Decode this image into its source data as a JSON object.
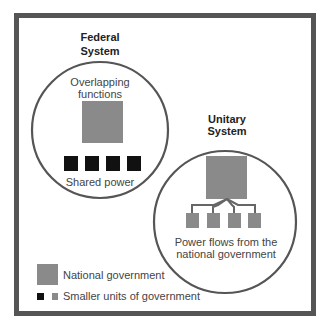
{
  "colors": {
    "frame": "#555555",
    "circle": "#555555",
    "national": "#8a8a8a",
    "federal_unit": "#111111",
    "unitary_unit": "#8a8a8a",
    "text": "#444444"
  },
  "federal": {
    "title_line1": "Federal",
    "title_line2": "System",
    "top_caption_line1": "Overlapping",
    "top_caption_line2": "functions",
    "bottom_caption": "Shared power",
    "unit_count": 4
  },
  "unitary": {
    "title_line1": "Unitary",
    "title_line2": "System",
    "caption_line1": "Power flows from the",
    "caption_line2": "national government",
    "unit_count": 4
  },
  "legend": {
    "national_label": "National government",
    "smaller_label": "Smaller units of government"
  }
}
